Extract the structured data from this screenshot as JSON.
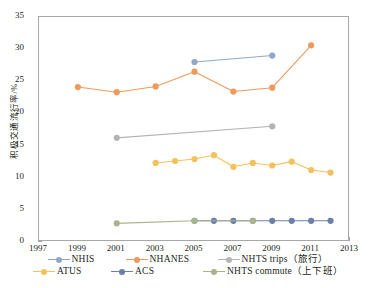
{
  "chart_data": {
    "type": "line",
    "title": "",
    "xlabel": "",
    "ylabel": "积极交通流行率/%",
    "xlim": [
      1997,
      2013
    ],
    "ylim": [
      0,
      35
    ],
    "xticks": [
      "1997",
      "1999",
      "2001",
      "2003",
      "2005",
      "2007",
      "2009",
      "2011",
      "2013"
    ],
    "yticks": [
      "0",
      "5",
      "10",
      "15",
      "20",
      "25",
      "30",
      "35"
    ],
    "grid": false,
    "legend_position": "bottom",
    "series": [
      {
        "name": "NHIS",
        "color": "#8fa8c8",
        "x": [
          2005,
          2009
        ],
        "values": [
          28.0,
          29.0
        ]
      },
      {
        "name": "NHANES",
        "color": "#ed9a5c",
        "x": [
          1999,
          2001,
          2003,
          2005,
          2007,
          2009,
          2011
        ],
        "values": [
          24.1,
          23.3,
          24.2,
          26.5,
          23.4,
          24.0,
          30.6
        ]
      },
      {
        "name": "NHTS trips（旅行）",
        "color": "#b4b4b4",
        "x": [
          2001,
          2009
        ],
        "values": [
          16.2,
          18.0
        ]
      },
      {
        "name": "ATUS",
        "color": "#f3c25c",
        "x": [
          2003,
          2004,
          2005,
          2006,
          2007,
          2008,
          2009,
          2010,
          2011,
          2012
        ],
        "values": [
          12.3,
          12.6,
          12.9,
          13.5,
          11.7,
          12.3,
          11.9,
          12.5,
          11.2,
          10.8
        ]
      },
      {
        "name": "ACS",
        "color": "#6b7fa8",
        "x": [
          2005,
          2006,
          2007,
          2008,
          2009,
          2010,
          2011,
          2012
        ],
        "values": [
          3.3,
          3.3,
          3.3,
          3.3,
          3.3,
          3.3,
          3.3,
          3.3
        ]
      },
      {
        "name": "NHTS commute（上下班）",
        "color": "#a8b489",
        "x": [
          2001,
          2005,
          2008
        ],
        "values": [
          2.9,
          3.3,
          3.3
        ]
      }
    ]
  },
  "axis": {
    "y_title": "积极交通流行率/%"
  },
  "legend": {
    "rows": [
      [
        {
          "label": "NHIS",
          "color": "#8fa8c8"
        },
        {
          "label": "NHANES",
          "color": "#ed9a5c"
        },
        {
          "label": "NHTS trips（旅行）",
          "color": "#b4b4b4"
        }
      ],
      [
        {
          "label": "ATUS",
          "color": "#f3c25c"
        },
        {
          "label": "ACS",
          "color": "#6b7fa8"
        },
        {
          "label": "NHTS commute（上下班）",
          "color": "#a8b489"
        }
      ]
    ]
  }
}
